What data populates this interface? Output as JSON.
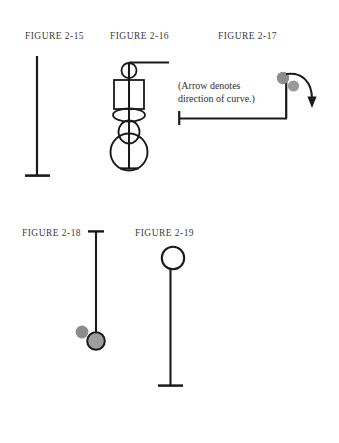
{
  "page": {
    "width": 339,
    "height": 443,
    "background": "#ffffff",
    "ink_color": "#1a1a1a",
    "label_color": "#3b3b3b",
    "accent_gray": "#8c8c8c",
    "accent_gray_dark": "#7a7a7a"
  },
  "figures": [
    {
      "id": "figure-2-15",
      "label": "FIGURE 2-15",
      "label_x": 25,
      "label_y": 39,
      "description": "vertical rod with flat base"
    },
    {
      "id": "figure-2-16",
      "label": "FIGURE 2-16",
      "label_x": 110,
      "label_y": 39,
      "description": "vertical rod with small circle, rectangle, flat ellipse, oval and large circle, horizontal bar at top"
    },
    {
      "id": "figure-2-17",
      "label": "FIGURE 2-17",
      "label_x": 218,
      "label_y": 39,
      "description": "L-shaped line with two gray spheres and curved direction arrow"
    },
    {
      "id": "figure-2-18",
      "label": "FIGURE 2-18",
      "label_x": 22,
      "label_y": 236,
      "description": "vertical rod with top cap, gray sphere and outlined circle at the bottom"
    },
    {
      "id": "figure-2-19",
      "label": "FIGURE 2-19",
      "label_x": 135,
      "label_y": 236,
      "description": "vertical rod with open circle on top and flat base"
    }
  ],
  "annotations": {
    "arrow_note_line1": "(Arrow denotes",
    "arrow_note_line2": "direction of curve.)",
    "arrow_note_x": 178,
    "arrow_note_y": 85
  }
}
